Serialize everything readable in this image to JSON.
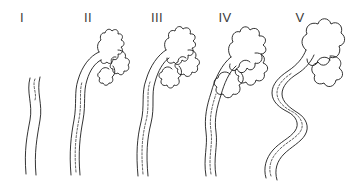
{
  "figure": {
    "background_color": "#ffffff",
    "ink_color": "#1c1c1c",
    "label_color": "#3a3a3a",
    "width": 350,
    "height": 185,
    "panel_count": 5
  },
  "panels": [
    {
      "label": "I",
      "label_x": 22,
      "label_y": 22,
      "name": "stage-one",
      "description": "Narrow, nearly straight vessel with a gentle S-curve; two parallel wall lines with a faint dashed lumen line at the top.",
      "stage": 1
    },
    {
      "label": "II",
      "label_x": 88,
      "label_y": 22,
      "name": "stage-two",
      "description": "Vessel ascends and hooks over into a small lobulated crown with a few short finger-like projections.",
      "stage": 2
    },
    {
      "label": "III",
      "label_x": 157,
      "label_y": 22,
      "name": "stage-three",
      "description": "Larger, more deeply indented lobulated mass at the top; the ascending limb is slightly wider and dashed lumen is prominent.",
      "stage": 3
    },
    {
      "label": "IV",
      "label_x": 225,
      "label_y": 22,
      "name": "stage-four",
      "description": "Broad, markedly convoluted lobulated mass; the vertical limb becomes wavy and dilated along its length.",
      "stage": 4
    },
    {
      "label": "V",
      "label_x": 300,
      "label_y": 22,
      "name": "stage-five",
      "description": "Greatly dilated and serpentine vessel forming a large looping S-shape below an expanded, grossly lobulated head.",
      "stage": 5
    }
  ],
  "geometry": {
    "panel_1": {
      "wall_left": "M 30 78 C 26 92 33 104 30 120 C 27 136 24 150 26 174",
      "wall_right": "M 40 77 C 36 92 43 104 40 120 C 37 138 34 152 36 175",
      "lumen": "M 35 79 C 32 86 37 93 35 100"
    },
    "panel_2": {
      "wall_outer": "M 71 175 C 69 152 71 136 74 120 C 77 104 74 92 78 80 C 82 66 90 56 99 52",
      "wall_inner": "M 80 175 C 78 152 80 136 83 120 C 86 104 83 92 87 80 C 90 70 95 63 101 60",
      "crown": "M 99 52 C 96 47 98 42 101 40 C 99 36 102 32 105 33 C 106 29 110 28 112 31 C 115 28 119 30 118 34 C 122 33 124 37 121 40 C 125 41 125 46 121 47 C 124 50 122 55 118 54 C 119 58 116 61 113 59 C 113 63 109 65 107 62 C 104 65 100 63 101 60",
      "branch_a": "M 118 50 C 123 50 127 54 125 58 C 129 58 131 62 128 65 C 130 68 128 72 124 71 C 124 75 120 76 118 73 C 115 75 112 72 113 69 C 110 69 109 65 112 63 C 110 60 112 56 116 57",
      "branch_b": "M 113 66 C 116 70 115 75 112 77 C 114 80 112 84 109 83 C 108 86 104 86 103 83 C 100 84 98 81 100 78 C 97 77 97 73 100 72 C 101 68 106 66 109 69",
      "lumen": "M 76 172 C 74 150 76 135 79 119 C 82 103 79 92 82 82"
    },
    "panel_3": {
      "wall_outer": "M 138 176 C 136 154 137 138 141 122 C 145 106 141 93 146 80 C 150 66 158 55 166 50",
      "wall_inner": "M 148 176 C 146 154 147 139 151 123 C 155 107 151 94 155 82 C 158 71 163 62 169 58",
      "crown": "M 166 50 C 163 45 165 39 169 38 C 167 33 171 29 175 31 C 176 26 181 25 183 29 C 187 26 192 29 190 34 C 195 33 197 38 193 41 C 197 43 196 48 192 48 C 195 52 192 57 188 55 C 189 60 185 63 182 60 C 181 65 176 66 174 62 C 170 65 166 62 167 58",
      "branch_a": "M 188 50 C 194 49 198 54 195 58 C 200 59 201 64 197 66 C 199 70 196 74 192 72 C 191 77 186 78 184 74 C 180 76 176 73 178 69 C 174 68 174 63 178 62 C 178 57 183 55 186 58",
      "branch_b": "M 179 66 C 183 70 182 76 178 78 C 181 82 178 87 174 85 C 173 89 168 89 167 85 C 163 87 159 83 162 79 C 158 78 158 73 162 72 C 163 67 169 65 172 69",
      "lumen": "M 143 174 C 141 152 142 137 146 121 C 150 105 146 93 150 82"
    },
    "panel_4": {
      "wall_outer": "M 206 176 C 203 158 208 146 206 132 C 204 118 207 105 211 93 C 215 78 222 64 231 57",
      "wall_inner": "M 216 176 C 213 158 218 146 216 132 C 214 119 217 107 221 95 C 224 84 229 72 236 66",
      "crown": "M 231 57 C 227 52 228 44 233 42 C 230 36 235 30 240 32 C 241 26 248 25 250 30 C 255 26 261 30 259 36 C 265 35 268 41 263 45 C 268 48 266 54 261 54 C 264 59 260 65 255 63 C 256 69 250 72 247 68 C 245 74 239 74 237 69 C 233 73 228 69 230 64",
      "branch_a": "M 255 53 C 262 52 267 58 263 63 C 269 65 269 71 264 73 C 266 78 261 83 256 80 C 255 86 248 87 246 82 C 241 85 236 81 239 76 C 234 75 234 69 239 67 C 239 61 246 58 250 62",
      "branch_b": "M 240 72 C 245 76 244 83 239 85 C 242 90 238 96 233 94 C 231 99 225 99 223 94 C 218 96 214 91 217 87 C 213 85 213 79 218 78 C 219 72 226 70 230 74",
      "lumen": "M 211 174 C 208 157 213 145 211 131 C 209 118 212 106 216 94"
    },
    "panel_5": {
      "wall_outer": "M 266 178 C 263 168 266 158 273 150 C 280 142 290 138 295 131 C 300 124 296 116 288 112 C 280 108 272 102 272 93 C 272 84 279 77 288 71 C 297 65 303 58 306 50",
      "wall_inner": "M 277 180 C 274 170 277 161 284 154 C 291 147 301 142 305 135 C 310 127 306 118 298 113 C 290 108 282 102 282 94 C 282 86 289 79 297 74 C 305 69 311 62 314 55",
      "crown": "M 306 50 C 300 45 301 37 307 34 C 304 27 311 21 318 24 C 320 17 329 17 331 24 C 337 20 344 26 341 33 C 347 37 345 45 339 46 C 342 53 336 60 330 57 C 330 65 322 68 318 62 C 314 68 307 66 307 59",
      "branch_a": "M 330 56 C 338 55 344 62 339 68 C 345 72 343 80 336 80 C 335 87 327 89 324 83 C 318 86 312 81 315 75 C 310 72 311 64 317 63 C 318 57 327 55 330 60",
      "lumen": "M 271 176 C 268 167 271 158 278 151 C 285 143 295 139 300 132 C 305 125 301 117 293 112 C 285 108 277 102 277 93 C 277 85 284 78 292 73"
    }
  }
}
